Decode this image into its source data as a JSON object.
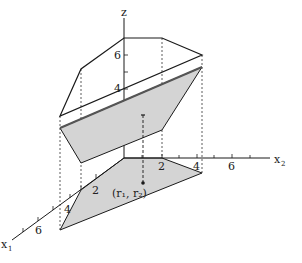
{
  "figure": {
    "type": "3d-piecewise-linear-surface",
    "colors": {
      "line": "#1a1a1a",
      "fill": "#d4d4d4",
      "dotted": "#333333"
    },
    "axes": {
      "z": {
        "label": "z",
        "ticks": [
          "4",
          "6"
        ]
      },
      "x2": {
        "label": "x",
        "subscript": "2",
        "ticks": [
          "2",
          "4",
          "6"
        ]
      },
      "x1": {
        "label": "x",
        "subscript": "1",
        "ticks": [
          "2",
          "4",
          "6"
        ]
      }
    },
    "point_label": "(r₁, r₂)"
  }
}
